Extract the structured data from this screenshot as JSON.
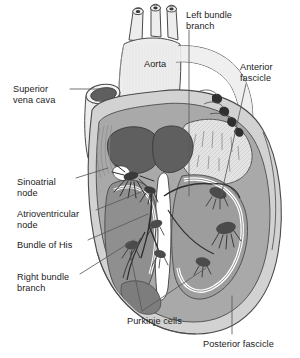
{
  "figure": {
    "width": 300,
    "height": 358,
    "background": "#ffffff"
  },
  "palette": {
    "outline": "#4a4a4a",
    "leader_line": "#5a5a5a",
    "text": "#1c1c1c",
    "vessel_light": "#ededed",
    "epicardium": "#d2d2d2",
    "myocardium": "#a9a9a9",
    "myocardium_dark": "#8f8f8f",
    "chamber_dark": "#5f5f5f",
    "chamber_mid": "#6e6e6e",
    "endocardium_white": "#ffffff",
    "purkinje_dark": "#4b4b4b",
    "node_dark": "#3a3a3a"
  },
  "labels": [
    {
      "id": "superior-vena-cava",
      "text": "Superior\nvena cava",
      "x": 13,
      "y": 84,
      "align": "left"
    },
    {
      "id": "aorta",
      "text": "Aorta",
      "x": 144,
      "y": 59,
      "align": "left"
    },
    {
      "id": "left-bundle-branch",
      "text": "Left bundle\nbranch",
      "x": 186,
      "y": 10,
      "align": "left"
    },
    {
      "id": "anterior-fascicle",
      "text": "Anterior\nfascicle",
      "x": 240,
      "y": 62,
      "align": "left"
    },
    {
      "id": "sinoatrial-node",
      "text": "Sinoatrial\nnode",
      "x": 17,
      "y": 177,
      "align": "left"
    },
    {
      "id": "atrioventricular-node",
      "text": "Atrioventricular\nnode",
      "x": 17,
      "y": 209,
      "align": "left"
    },
    {
      "id": "bundle-of-his",
      "text": "Bundle of His",
      "x": 17,
      "y": 240,
      "align": "left"
    },
    {
      "id": "right-bundle-branch",
      "text": "Right bundle\nbranch",
      "x": 17,
      "y": 272,
      "align": "left"
    },
    {
      "id": "purkinje-cells",
      "text": "Purkinje cells",
      "x": 127,
      "y": 316,
      "align": "left"
    },
    {
      "id": "posterior-fascicle",
      "text": "Posterior fascicle",
      "x": 203,
      "y": 339,
      "align": "left"
    }
  ],
  "anatomy_parts": [
    "superior vena cava",
    "aorta",
    "pulmonary trunk",
    "right atrium",
    "left atrium",
    "right ventricle",
    "left ventricle",
    "interventricular septum",
    "sinoatrial node",
    "atrioventricular node",
    "bundle of His",
    "right bundle branch",
    "left bundle branch",
    "anterior fascicle",
    "posterior fascicle",
    "Purkinje cells"
  ]
}
